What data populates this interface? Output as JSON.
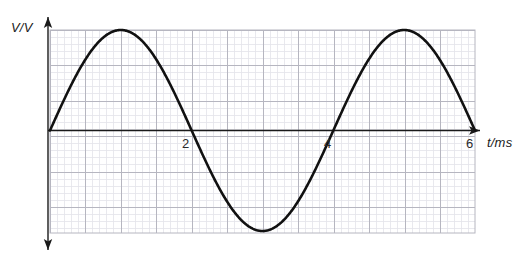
{
  "figure": {
    "name": "sinusoidal-voltage-time-graph",
    "background_color": "#ffffff",
    "width": 530,
    "height": 262
  },
  "axes": {
    "y_caption": "V/V",
    "x_caption": "t/ms",
    "axis_color": "#1a1a1a",
    "x_axis_y_px": 130.5,
    "y_axis_x_px": 48
  },
  "grid": {
    "minor_color": "#e3e3ea",
    "major_color": "#b6b6c0",
    "minor_step_px": 7.1,
    "major_step_px": 35.5,
    "left_px": 50,
    "right_px": 475,
    "top_px": 30,
    "bottom_px": 233,
    "show_minor": true,
    "show_major": true
  },
  "ticks": {
    "x": [
      {
        "label": "2",
        "value": 2,
        "x_px": 192
      },
      {
        "label": "4",
        "value": 4,
        "x_px": 334
      },
      {
        "label": "6",
        "value": 6,
        "x_px": 475
      }
    ]
  },
  "curve": {
    "color": "#111111",
    "stroke_width": 2.6
  },
  "chart_data": {
    "type": "line",
    "title": "",
    "subtitle": "",
    "xlabel": "t/ms",
    "ylabel": "V/V",
    "xlim": [
      0,
      6
    ],
    "ylim": [
      -1,
      1
    ],
    "xticks": [
      2,
      4,
      6
    ],
    "xticklabels": [
      "2",
      "4",
      "6"
    ],
    "yticks": [],
    "yticklabels": [],
    "grid": true,
    "legend": null,
    "annotations": [],
    "series": [
      {
        "name": "V(t)",
        "equation": "V = A sin(2*pi*t/4)",
        "amplitude": 1,
        "period_ms": 4,
        "frequency_khz": 0.25,
        "phase": 0,
        "x": [
          0,
          0.25,
          0.5,
          0.75,
          1,
          1.25,
          1.5,
          1.75,
          2,
          2.25,
          2.5,
          2.75,
          3,
          3.25,
          3.5,
          3.75,
          4,
          4.25,
          4.5,
          4.75,
          5,
          5.25,
          5.5,
          5.75,
          6
        ],
        "values": [
          0,
          0.383,
          0.707,
          0.924,
          1,
          0.924,
          0.707,
          0.383,
          0,
          -0.383,
          -0.707,
          -0.924,
          -1,
          -0.924,
          -0.707,
          -0.383,
          0,
          0.383,
          0.707,
          0.924,
          1,
          0.924,
          0.707,
          0.383,
          0
        ]
      }
    ],
    "key_points": [
      {
        "label": "zero-start",
        "t": 0,
        "v": 0
      },
      {
        "label": "peak-1",
        "t": 1,
        "v": 1
      },
      {
        "label": "zero-crossing-1",
        "t": 2,
        "v": 0
      },
      {
        "label": "trough-1",
        "t": 3,
        "v": -1
      },
      {
        "label": "zero-crossing-2",
        "t": 4,
        "v": 0
      },
      {
        "label": "peak-2",
        "t": 5,
        "v": 1
      },
      {
        "label": "zero-end",
        "t": 6,
        "v": 0
      }
    ]
  }
}
